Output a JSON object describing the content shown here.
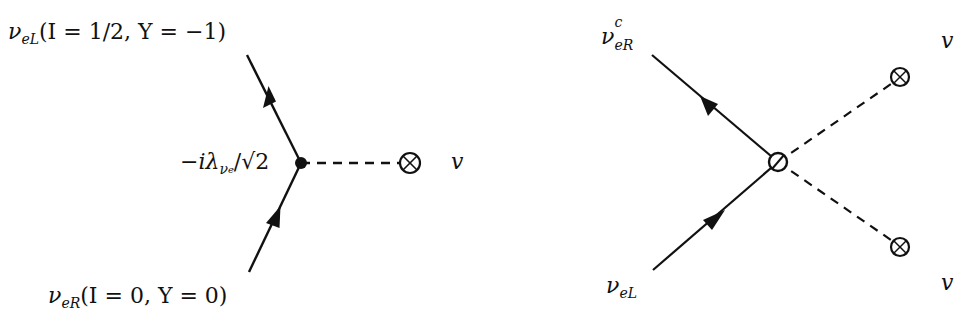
{
  "left_diagram": {
    "top_label": {
      "particle": "ν",
      "sub": "eL",
      "quantum_numbers": "(I = 1/2, Y = −1)"
    },
    "bottom_label": {
      "particle": "ν",
      "sub": "eR",
      "quantum_numbers": "(I = 0, Y = 0)"
    },
    "vertex_label": {
      "prefix": "−iλ",
      "sub": "ν",
      "subsub": "e",
      "suffix": "/√2"
    },
    "vev_label": "v"
  },
  "right_diagram": {
    "top_left_label": {
      "particle": "ν",
      "sup": "c",
      "sub": "eR"
    },
    "bottom_left_label": {
      "particle": "ν",
      "sub": "eL"
    },
    "top_right_label": "v",
    "bottom_right_label": "v"
  },
  "colors": {
    "line": "#111111",
    "background": "#ffffff"
  }
}
